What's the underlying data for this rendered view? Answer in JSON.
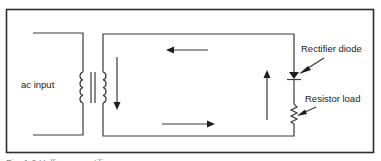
{
  "diagram": {
    "labels": {
      "ac_input": "ac input",
      "rectifier_diode": "Rectifier diode",
      "resistor_load": "Resistor load"
    },
    "caption": "Fig. 1-9 Half-wave rectifier"
  },
  "colors": {
    "line": "#3a3a3a",
    "frame": "#2e2e2e",
    "background": "#ffffff"
  }
}
